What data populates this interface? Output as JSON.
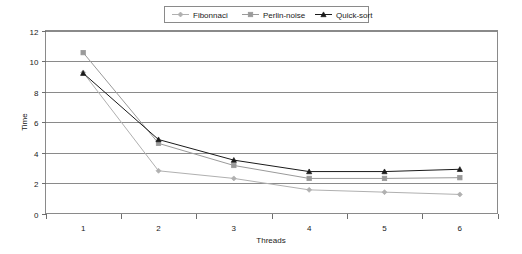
{
  "chart_data": {
    "type": "line",
    "title": "",
    "xlabel": "Threads",
    "ylabel": "Time",
    "x": [
      1,
      2,
      3,
      4,
      5,
      6
    ],
    "xtick_labels": [
      "1",
      "2",
      "3",
      "4",
      "5",
      "6"
    ],
    "ytick_labels": [
      "0",
      "2",
      "4",
      "6",
      "8",
      "10",
      "12"
    ],
    "yticks": [
      0,
      2,
      4,
      6,
      8,
      10,
      12
    ],
    "xlim": [
      0.5,
      6.5
    ],
    "ylim": [
      0,
      12
    ],
    "grid": "horizontal",
    "legend_position": "top-center",
    "series": [
      {
        "name": "Fibonnaci",
        "color": "#b0b0b0",
        "marker": "diamond",
        "values": [
          9.25,
          2.8,
          2.3,
          1.55,
          1.4,
          1.25
        ]
      },
      {
        "name": "Perlin-noise",
        "color": "#9a9a9a",
        "marker": "square",
        "values": [
          10.55,
          4.6,
          3.15,
          2.3,
          2.3,
          2.35
        ]
      },
      {
        "name": "Quick-sort",
        "color": "#1a1a1a",
        "marker": "triangle",
        "values": [
          9.2,
          4.85,
          3.5,
          2.75,
          2.75,
          2.9
        ]
      }
    ]
  },
  "colors": {
    "frame": "#8a8a8a",
    "grid": "#8a8a8a",
    "text": "#1a1a1a",
    "background": "#ffffff"
  }
}
